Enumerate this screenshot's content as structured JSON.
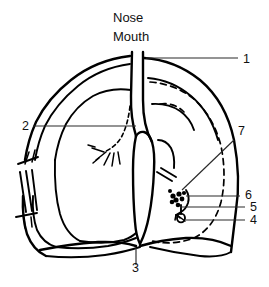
{
  "figure": {
    "background_color": "#ffffff",
    "line_color": "#000000",
    "leader_color": "#2a2a2a"
  },
  "word_labels": [
    {
      "id": "nose",
      "text": "Nose",
      "x": 113,
      "y": 22
    },
    {
      "id": "mouth",
      "text": "Mouth",
      "x": 113,
      "y": 41
    }
  ],
  "number_labels": [
    {
      "id": "callout-1",
      "text": "1",
      "x": 243,
      "y": 63
    },
    {
      "id": "callout-2",
      "text": "2",
      "x": 22,
      "y": 130
    },
    {
      "id": "callout-3",
      "text": "3",
      "x": 132,
      "y": 272
    },
    {
      "id": "callout-4",
      "text": "4",
      "x": 250,
      "y": 224
    },
    {
      "id": "callout-5",
      "text": "5",
      "x": 250,
      "y": 211
    },
    {
      "id": "callout-6",
      "text": "6",
      "x": 245,
      "y": 199
    },
    {
      "id": "callout-7",
      "text": "7",
      "x": 238,
      "y": 135
    }
  ],
  "leader_lines": [
    {
      "id": "leader-1",
      "from": [
        238,
        58
      ],
      "to": [
        146,
        58
      ]
    },
    {
      "id": "leader-2",
      "from": [
        33,
        126
      ],
      "to": [
        136,
        126
      ]
    },
    {
      "id": "leader-3",
      "from": [
        136,
        265
      ],
      "to": [
        136,
        248
      ]
    },
    {
      "id": "leader-4",
      "from": [
        245,
        220
      ],
      "to": [
        186,
        220
      ]
    },
    {
      "id": "leader-5",
      "from": [
        245,
        207
      ],
      "to": [
        180,
        207
      ]
    },
    {
      "id": "leader-6",
      "from": [
        240,
        196
      ],
      "to": [
        186,
        196
      ]
    },
    {
      "id": "leader-7",
      "from": [
        234,
        140
      ],
      "to": [
        182,
        190
      ]
    }
  ]
}
